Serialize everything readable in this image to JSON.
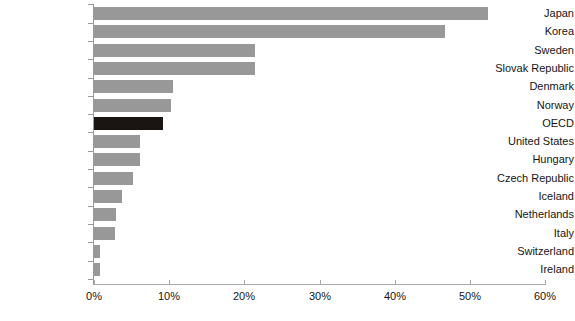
{
  "chart_data": {
    "type": "bar",
    "orientation": "horizontal",
    "title": "",
    "subtitle": "",
    "xlabel": "",
    "ylabel": "",
    "xlim": [
      0,
      60
    ],
    "xticks": [
      0,
      10,
      20,
      30,
      40,
      50,
      60
    ],
    "xtick_labels": [
      "0%",
      "10%",
      "20%",
      "30%",
      "40%",
      "50%",
      "60%"
    ],
    "grid": false,
    "legend": null,
    "value_unit": "%",
    "bar_color": "#989898",
    "highlight_color": "#1a1512",
    "highlight_category": "OECD",
    "axis_color": "#9a9a9a",
    "categories": [
      "Japan",
      "Korea",
      "Sweden",
      "Slovak Republic",
      "Denmark",
      "Norway",
      "OECD",
      "United States",
      "Hungary",
      "Czech Republic",
      "Iceland",
      "Netherlands",
      "Italy",
      "Switzerland",
      "Ireland"
    ],
    "values": [
      52.4,
      46.7,
      21.4,
      21.4,
      10.5,
      10.2,
      9.2,
      6.1,
      6.1,
      5.2,
      3.7,
      2.9,
      2.8,
      0.8,
      0.8
    ]
  }
}
